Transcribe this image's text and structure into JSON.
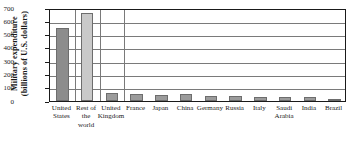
{
  "chart_data": {
    "type": "bar",
    "title": "",
    "xlabel": "",
    "ylabel_line1": "Military expenditure",
    "ylabel_line2": "(billions of U.S. dollars)",
    "ylabel": "Military expenditure (billions of U.S. dollars)",
    "ylim": [
      0,
      700
    ],
    "ytick_labels": [
      "700",
      "600",
      "500",
      "400",
      "300",
      "200",
      "100",
      "0"
    ],
    "ytick_values": [
      700,
      600,
      500,
      400,
      300,
      200,
      100,
      0
    ],
    "grid": "horizontal gridlines at every 100 units; vertical gridlines separating first categories",
    "legend": "none",
    "categories": [
      "United States",
      "Rest of the world",
      "United Kingdom",
      "France",
      "Japan",
      "China",
      "Germany",
      "Russia",
      "Italy",
      "Saudi Arabia",
      "India",
      "Brazil"
    ],
    "category_lines": [
      [
        "United",
        "States"
      ],
      [
        "Rest of",
        "the",
        "world"
      ],
      [
        "United",
        "Kingdom"
      ],
      [
        "France"
      ],
      [
        "Japan"
      ],
      [
        "China"
      ],
      [
        "Germany"
      ],
      [
        "Russia"
      ],
      [
        "Italy"
      ],
      [
        "Saudi",
        "Arabia"
      ],
      [
        "India"
      ],
      [
        "Brazil"
      ]
    ],
    "values": [
      548,
      663,
      58,
      54,
      45,
      50,
      40,
      38,
      31,
      33,
      27,
      16
    ],
    "bar_colors": [
      "#8c8c8c",
      "#c9c9c9",
      "#9b9b9b",
      "#9b9b9b",
      "#9b9b9b",
      "#9b9b9b",
      "#9b9b9b",
      "#9b9b9b",
      "#9b9b9b",
      "#9b9b9b",
      "#9b9b9b",
      "#9b9b9b"
    ]
  },
  "style": {
    "background": "#ffffff",
    "axis_color": "#1a1a1a",
    "grid_color": "#7a7a7a",
    "bar_edge_color": "#6d6d6d"
  }
}
